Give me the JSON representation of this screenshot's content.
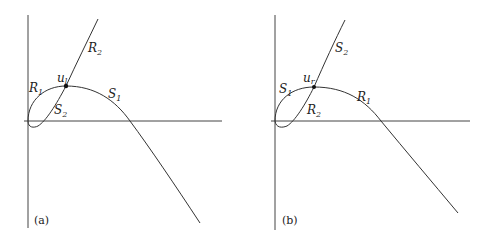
{
  "figure": {
    "panels": [
      {
        "id": "a",
        "panel_label": "(a)",
        "point_label": {
          "base": "u",
          "sub": "l"
        },
        "curve_labels": [
          {
            "base": "R",
            "sub": "2",
            "role": "upper-branch"
          },
          {
            "base": "R",
            "sub": "1",
            "role": "loop-upper-left"
          },
          {
            "base": "S",
            "sub": "2",
            "role": "loop-lower"
          },
          {
            "base": "S",
            "sub": "1",
            "role": "descending-branch"
          }
        ]
      },
      {
        "id": "b",
        "panel_label": "(b)",
        "point_label": {
          "base": "u",
          "sub": "r"
        },
        "curve_labels": [
          {
            "base": "S",
            "sub": "2",
            "role": "upper-branch"
          },
          {
            "base": "S",
            "sub": "1",
            "role": "loop-upper-left"
          },
          {
            "base": "R",
            "sub": "2",
            "role": "loop-lower"
          },
          {
            "base": "R",
            "sub": "1",
            "role": "descending-branch"
          }
        ]
      }
    ],
    "colors": {
      "line": "#333333",
      "background": "#ffffff"
    }
  }
}
